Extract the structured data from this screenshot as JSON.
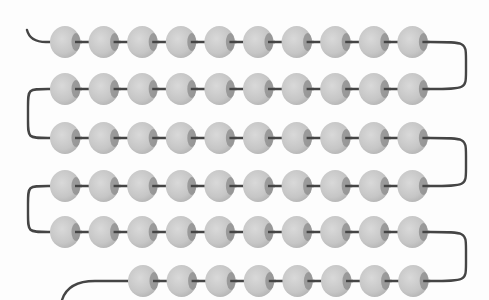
{
  "figure": {
    "description": "Beads threaded on a single string, arranged in a serpentine pattern",
    "rows": [
      {
        "y": 42,
        "count": 10,
        "start_x": 65
      },
      {
        "y": 89,
        "count": 10,
        "start_x": 65
      },
      {
        "y": 138,
        "count": 10,
        "start_x": 65
      },
      {
        "y": 186,
        "count": 10,
        "start_x": 65
      },
      {
        "y": 232,
        "count": 10,
        "start_x": 65
      },
      {
        "y": 281,
        "count": 8,
        "start_x": 143
      }
    ],
    "bead_spacing": 38.6,
    "bead_rx": 15,
    "bead_ry": 16,
    "total_beads": 58,
    "beads_per_full_row": 10,
    "full_rows": 5,
    "partial_row_beads": 8,
    "colors": {
      "bead": "#c6c6c6",
      "bead_light": "#d8d8d8",
      "bead_hole": "#8e8e8e",
      "string": "#454545",
      "background": "#fdfdfd"
    }
  }
}
